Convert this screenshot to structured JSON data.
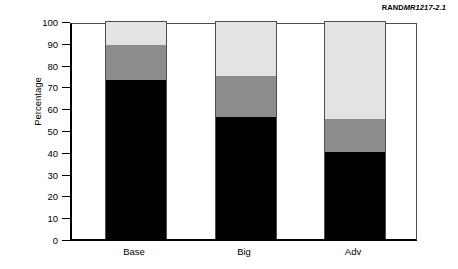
{
  "credit": {
    "brand": "RAND",
    "code": "MR1217-2.1"
  },
  "chart_data": {
    "type": "bar",
    "subtype": "stacked-bar",
    "title": "",
    "xlabel": "",
    "ylabel": "Percentage",
    "ylim": [
      0,
      100
    ],
    "yticks": [
      0,
      10,
      20,
      30,
      40,
      50,
      60,
      70,
      80,
      90,
      100
    ],
    "grid": false,
    "legend": "none",
    "categories": [
      "Base",
      "Big",
      "Adv"
    ],
    "series": [
      {
        "name": "bottom-segment",
        "color": "#000000",
        "values": [
          73,
          56,
          40
        ]
      },
      {
        "name": "middle-segment",
        "color": "#8c8c8c",
        "values": [
          16,
          19,
          15
        ]
      },
      {
        "name": "top-segment",
        "color": "#e3e3e3",
        "values": [
          11,
          25,
          45
        ]
      }
    ],
    "stack_totals": [
      100,
      100,
      100
    ]
  },
  "axis": {
    "tick_labels": [
      "100",
      "90",
      "80",
      "70",
      "60",
      "50",
      "40",
      "30",
      "20",
      "10",
      "0"
    ],
    "y_title": "Percentage"
  },
  "colors": {
    "bottom": "#000000",
    "middle": "#8c8c8c",
    "top": "#e3e3e3",
    "frame": "#4d4d4d",
    "axis": "#000000"
  }
}
